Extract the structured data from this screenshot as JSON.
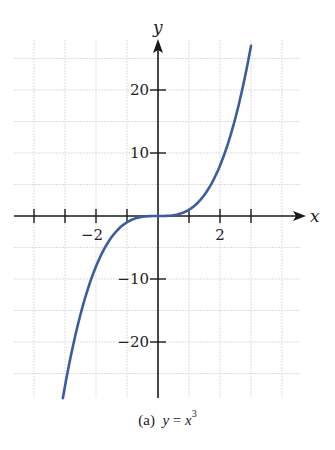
{
  "chart_data": {
    "type": "line",
    "title": "",
    "caption_prefix": "(a)",
    "caption_lhs": "y",
    "caption_eq": "=",
    "caption_rhs": "x",
    "caption_exp": "3",
    "function": "y = x^3",
    "xlabel": "x",
    "ylabel": "y",
    "xlim": [
      -4.2,
      4.7
    ],
    "ylim": [
      -29,
      28
    ],
    "x_ticks": [
      -4,
      -3,
      -2,
      -1,
      0,
      1,
      2,
      3
    ],
    "x_tick_labels": [
      {
        "value": -2,
        "label": "−2"
      },
      {
        "value": 2,
        "label": "2"
      }
    ],
    "y_ticks": [
      -20,
      -10,
      10,
      20
    ],
    "y_tick_labels": [
      {
        "value": 20,
        "label": "20"
      },
      {
        "value": 10,
        "label": "10"
      },
      {
        "value": -10,
        "label": "−10"
      },
      {
        "value": -20,
        "label": "−20"
      }
    ],
    "grid": true,
    "series": [
      {
        "name": "y = x^3",
        "color": "#3b5c9e",
        "x": [
          -3.07,
          -3.0,
          -2.75,
          -2.5,
          -2.25,
          -2.0,
          -1.75,
          -1.5,
          -1.25,
          -1.0,
          -0.75,
          -0.5,
          -0.25,
          0.0,
          0.25,
          0.5,
          0.75,
          1.0,
          1.25,
          1.5,
          1.75,
          2.0,
          2.25,
          2.5,
          2.75,
          3.0
        ],
        "y": [
          -28.9,
          -27.0,
          -20.8,
          -15.6,
          -11.4,
          -8.0,
          -5.4,
          -3.4,
          -2.0,
          -1.0,
          -0.4,
          -0.1,
          0.0,
          0.0,
          0.0,
          0.1,
          0.4,
          1.0,
          2.0,
          3.4,
          5.4,
          8.0,
          11.4,
          15.6,
          20.8,
          27.0
        ]
      }
    ]
  },
  "colors": {
    "axis": "#1a1a1a",
    "grid": "#d4d4d4",
    "curve": "#3b5c9e"
  }
}
